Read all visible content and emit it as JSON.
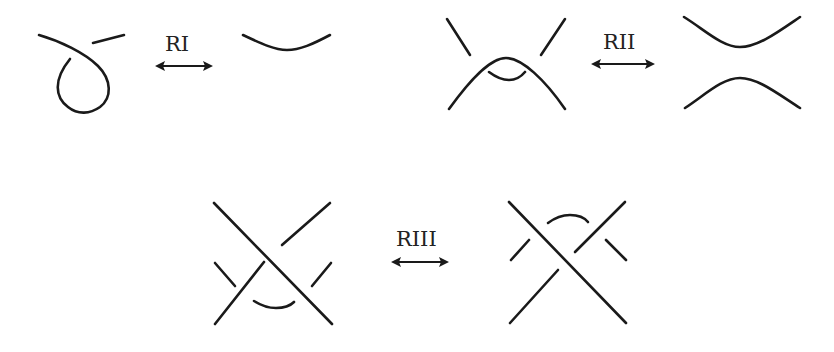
{
  "diagram": {
    "colors": {
      "stroke": "#1a1a1a",
      "background": "#ffffff"
    },
    "moves": [
      {
        "id": "RI",
        "label": "RI",
        "description": "Type I: twist / untwist a loop",
        "arrow": "double-headed"
      },
      {
        "id": "RII",
        "label": "RII",
        "description": "Type II: move one strand completely over another",
        "arrow": "double-headed"
      },
      {
        "id": "RIII",
        "label": "RIII",
        "description": "Type III: move a strand over/under a crossing",
        "arrow": "double-headed"
      }
    ]
  }
}
